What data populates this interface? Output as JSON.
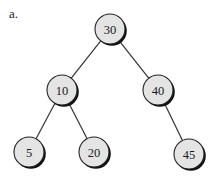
{
  "figure_label": "a.",
  "tree": {
    "type": "binary-search-tree",
    "radius": 15,
    "nodes": [
      {
        "id": "n30",
        "value": "30",
        "x": 110,
        "y": 29
      },
      {
        "id": "n10",
        "value": "10",
        "x": 62,
        "y": 90
      },
      {
        "id": "n40",
        "value": "40",
        "x": 158,
        "y": 90
      },
      {
        "id": "n5",
        "value": "5",
        "x": 29,
        "y": 152
      },
      {
        "id": "n20",
        "value": "20",
        "x": 94,
        "y": 152
      },
      {
        "id": "n45",
        "value": "45",
        "x": 189,
        "y": 154
      }
    ],
    "edges": [
      {
        "from": "n30",
        "to": "n10"
      },
      {
        "from": "n30",
        "to": "n40"
      },
      {
        "from": "n10",
        "to": "n5"
      },
      {
        "from": "n10",
        "to": "n20"
      },
      {
        "from": "n40",
        "to": "n45"
      }
    ]
  }
}
